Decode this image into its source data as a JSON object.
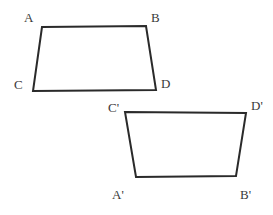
{
  "diagram": {
    "stroke_color": "#2a2a2a",
    "label_color": "#3a3a3a",
    "figures": [
      {
        "name": "quadrilateral-ABDC",
        "vertices": {
          "A": [
            42,
            27
          ],
          "B": [
            146,
            26
          ],
          "D": [
            156,
            90
          ],
          "C": [
            33,
            91
          ]
        },
        "points": "42,27 146,26 156,90 33,91",
        "labels": [
          {
            "text": "A",
            "x": 24,
            "y": 22
          },
          {
            "text": "B",
            "x": 151,
            "y": 22
          },
          {
            "text": "C",
            "x": 14,
            "y": 89
          },
          {
            "text": "D",
            "x": 161,
            "y": 88
          }
        ]
      },
      {
        "name": "quadrilateral-C'D'B'A'",
        "vertices": {
          "C'": [
            125,
            112
          ],
          "D'": [
            246,
            113
          ],
          "B'": [
            236,
            176
          ],
          "A'": [
            136,
            177
          ]
        },
        "points": "125,112 246,113 236,176 136,177",
        "labels": [
          {
            "text": "C'",
            "x": 108,
            "y": 112
          },
          {
            "text": "D'",
            "x": 251,
            "y": 110
          },
          {
            "text": "A'",
            "x": 112,
            "y": 199
          },
          {
            "text": "B'",
            "x": 240,
            "y": 199
          }
        ]
      }
    ]
  }
}
